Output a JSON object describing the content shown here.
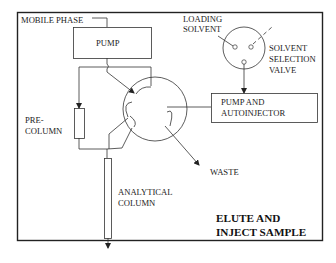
{
  "diagram": {
    "type": "hplc-flow-schematic",
    "title_line1": "ELUTE AND",
    "title_line2": "INJECT SAMPLE",
    "labels": {
      "mobile_phase": "MOBILE PHASE",
      "pump": "PUMP",
      "loading_solvent_1": "LOADING",
      "loading_solvent_2": "SOLVENT",
      "solvent_valve_1": "SOLVENT",
      "solvent_valve_2": "SELECTION",
      "solvent_valve_3": "VALVE",
      "pump_autoinjector_1": "PUMP AND",
      "pump_autoinjector_2": "AUTOINJECTOR",
      "precolumn_1": "PRE-",
      "precolumn_2": "COLUMN",
      "waste": "WASTE",
      "analytical_1": "ANALYTICAL",
      "analytical_2": "COLUMN"
    },
    "colors": {
      "line": "#333333",
      "frame": "#222222",
      "background": "#ffffff"
    }
  }
}
